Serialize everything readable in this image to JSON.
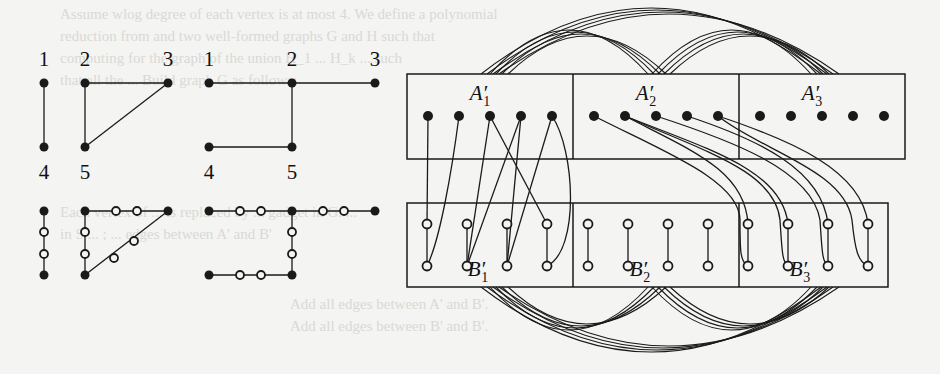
{
  "figure": {
    "colors": {
      "ink": "#1a1a1a",
      "background": "#f4f4f2",
      "bleed_text": "#d9d9d6"
    },
    "bleed_through_lines": [
      "Assume wlog degree of each vertex is at most 4. We define a polynomial",
      "reduction from and two well-formed graphs G and H such that",
      "computing for the graph of the union H_1 ... H_k ... such",
      "that all the ... Build graph G as follows:",
      "Each vertex of ... is replaced by ... gadget in G. ...",
      "in S ... ; ... edges between A' and B'",
      "Add all edges between A' and B'.",
      "Add all edges between B' and B'."
    ],
    "left_graphs": {
      "top_row": [
        {
          "name": "graph-a",
          "vertices": [
            {
              "id": "1",
              "x": 44,
              "y": 83,
              "label": "1",
              "label_pos": "above"
            },
            {
              "id": "2",
              "x": 85,
              "y": 83,
              "label": "2",
              "label_pos": "above"
            },
            {
              "id": "3",
              "x": 168,
              "y": 83,
              "label": "3",
              "label_pos": "above"
            },
            {
              "id": "4",
              "x": 44,
              "y": 147,
              "label": "4",
              "label_pos": "below"
            },
            {
              "id": "5",
              "x": 85,
              "y": 147,
              "label": "5",
              "label_pos": "below"
            }
          ],
          "edges": [
            [
              "1",
              "4"
            ],
            [
              "2",
              "3"
            ],
            [
              "2",
              "5"
            ],
            [
              "3",
              "5"
            ]
          ]
        },
        {
          "name": "graph-b",
          "vertices": [
            {
              "id": "1",
              "x": 209,
              "y": 83,
              "label": "1",
              "label_pos": "above"
            },
            {
              "id": "2",
              "x": 292,
              "y": 83,
              "label": "2",
              "label_pos": "above"
            },
            {
              "id": "3",
              "x": 375,
              "y": 83,
              "label": "3",
              "label_pos": "above"
            },
            {
              "id": "4",
              "x": 209,
              "y": 147,
              "label": "4",
              "label_pos": "below"
            },
            {
              "id": "5",
              "x": 292,
              "y": 147,
              "label": "5",
              "label_pos": "below"
            }
          ],
          "edges": [
            [
              "1",
              "2"
            ],
            [
              "2",
              "3"
            ],
            [
              "2",
              "5"
            ],
            [
              "4",
              "5"
            ]
          ]
        }
      ],
      "bottom_row_subdivided": {
        "filled": [
          [
            44,
            211
          ],
          [
            44,
            275
          ],
          [
            85,
            211
          ],
          [
            168,
            211
          ],
          [
            85,
            275
          ],
          [
            209,
            211
          ],
          [
            292,
            211
          ],
          [
            375,
            211
          ],
          [
            209,
            275
          ],
          [
            292,
            275
          ]
        ],
        "hollow": [
          [
            44,
            232
          ],
          [
            44,
            254
          ],
          [
            116,
            211
          ],
          [
            137,
            211
          ],
          [
            85,
            232
          ],
          [
            85,
            254
          ],
          [
            114,
            258
          ],
          [
            134,
            241
          ],
          [
            240,
            211
          ],
          [
            261,
            211
          ],
          [
            323,
            211
          ],
          [
            344,
            211
          ],
          [
            292,
            232
          ],
          [
            292,
            254
          ],
          [
            240,
            275
          ],
          [
            261,
            275
          ]
        ],
        "segments": [
          [
            44,
            211,
            44,
            275
          ],
          [
            85,
            211,
            168,
            211
          ],
          [
            85,
            211,
            85,
            275
          ],
          [
            85,
            275,
            168,
            211
          ],
          [
            209,
            211,
            375,
            211
          ],
          [
            292,
            211,
            292,
            275
          ],
          [
            209,
            275,
            292,
            275
          ]
        ]
      }
    },
    "blocks": {
      "top": {
        "box": {
          "x": 407,
          "y": 74,
          "w": 498,
          "h": 85
        },
        "dividers": [
          573,
          739
        ],
        "parts": [
          {
            "label": "A",
            "sub": "1",
            "label_x": 480,
            "label_y": 100,
            "dots": [
              428,
              459,
              490,
              521,
              552
            ]
          },
          {
            "label": "A",
            "sub": "2",
            "label_x": 646,
            "label_y": 100,
            "dots": [
              594,
              625,
              656,
              687,
              718
            ]
          },
          {
            "label": "A",
            "sub": "3",
            "label_x": 812,
            "label_y": 100,
            "dots": [
              760,
              791,
              822,
              853,
              884
            ]
          }
        ],
        "dot_y": 116
      },
      "bottom": {
        "box": {
          "x": 407,
          "y": 203,
          "w": 481,
          "h": 84
        },
        "dividers": [
          573,
          739
        ],
        "parts": [
          {
            "label": "B",
            "sub": "1",
            "label_x": 478,
            "label_y": 276,
            "cols": [
              427,
              467,
              507,
              547
            ]
          },
          {
            "label": "B",
            "sub": "2",
            "label_x": 640,
            "label_y": 276,
            "cols": [
              588,
              628,
              668,
              708
            ]
          },
          {
            "label": "B",
            "sub": "3",
            "label_x": 800,
            "label_y": 276,
            "cols": [
              748,
              788,
              828,
              868
            ]
          }
        ],
        "top_y": 224,
        "bottom_y": 266
      }
    },
    "cross_edges": [
      "M428,116 L427,224",
      "M459,116 C452,170 440,240 427,266",
      "M490,116 L467,266",
      "M490,116 L547,224",
      "M521,116 L467,266",
      "M521,116 L507,266",
      "M552,116 L507,266",
      "M552,116 C575,150 580,250 547,266",
      "M594,116 C660,150 740,180 740,220 C740,250 740,262 748,266",
      "M625,116 C690,150 745,170 748,224",
      "M625,116 C700,150 775,170 780,220 C782,250 782,262 788,266",
      "M625,116 C710,150 782,170 788,224",
      "M656,116 C730,140 812,170 820,220 C822,250 822,262 828,266",
      "M687,116 C760,140 822,170 828,224",
      "M718,116 C760,150 845,170 852,220 C855,250 858,262 868,266",
      "M718,116 C790,140 862,170 868,224"
    ],
    "arcs_top": [
      {
        "from": 481,
        "to": 830,
        "peak": 8,
        "base": 74
      },
      {
        "from": 490,
        "to": 657,
        "peak": 30,
        "base": 74
      },
      {
        "from": 652,
        "to": 820,
        "peak": 30,
        "base": 74
      }
    ],
    "arcs_bottom": [
      {
        "from": 481,
        "to": 830,
        "peak": 352,
        "base": 287
      },
      {
        "from": 490,
        "to": 657,
        "peak": 330,
        "base": 287
      },
      {
        "from": 652,
        "to": 820,
        "peak": 330,
        "base": 287
      }
    ],
    "arc_bundle_count": 4,
    "arc_bundle_spacing": 6
  }
}
